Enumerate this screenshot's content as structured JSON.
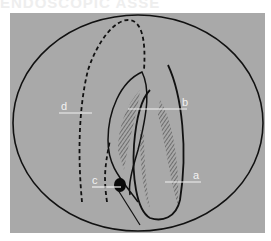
{
  "header": {
    "clipped_text": "ENDOSCOPIC ASSE"
  },
  "figure": {
    "background_color": "#a9a9a9",
    "line_color": "#111111",
    "label_color": "#f2f2f2",
    "labels": [
      {
        "id": "a",
        "text": "a"
      },
      {
        "id": "b",
        "text": "b"
      },
      {
        "id": "c",
        "text": "c"
      },
      {
        "id": "d",
        "text": "d"
      }
    ]
  }
}
